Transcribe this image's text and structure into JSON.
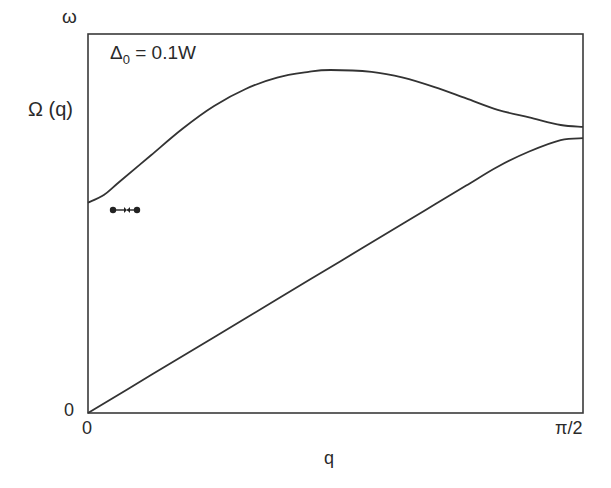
{
  "chart_data": {
    "type": "line",
    "title": "",
    "annotation": {
      "symbol": "Δ",
      "subscript": "0",
      "rest": " = 0.1W"
    },
    "xlabel": "q",
    "ylabel_top": "ω",
    "ylabel_mid": "Ω (q)",
    "x_ticks": [
      "0",
      "π/2"
    ],
    "y_ticks": [
      "0"
    ],
    "xlim": [
      0,
      1.5708
    ],
    "ylim": [
      0,
      1
    ],
    "grid": false,
    "legend": null,
    "series": [
      {
        "name": "upper branch Ω(q)",
        "x": [
          0,
          0.05,
          0.1,
          0.2,
          0.3,
          0.4,
          0.5,
          0.6,
          0.7,
          0.77,
          0.9,
          1.0,
          1.1,
          1.2,
          1.3,
          1.4,
          1.5,
          1.5708
        ],
        "y": [
          0.555,
          0.575,
          0.61,
          0.68,
          0.75,
          0.81,
          0.855,
          0.885,
          0.9,
          0.905,
          0.9,
          0.885,
          0.86,
          0.83,
          0.8,
          0.78,
          0.76,
          0.755
        ]
      },
      {
        "name": "lower branch (linear mode)",
        "x": [
          0,
          0.2,
          0.4,
          0.6,
          0.8,
          1.0,
          1.1,
          1.2,
          1.3,
          1.4,
          1.5,
          1.5708
        ],
        "y": [
          0,
          0.1,
          0.2,
          0.3,
          0.4,
          0.5,
          0.55,
          0.6,
          0.65,
          0.69,
          0.72,
          0.725
        ]
      }
    ],
    "markers": [
      {
        "description": "two dots with converging arrows",
        "glyph": "●→←●",
        "x": 0.11,
        "y": 0.535
      }
    ]
  }
}
